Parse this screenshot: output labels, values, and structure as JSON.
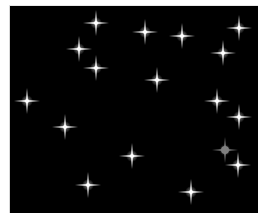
{
  "game": {
    "type": "sparkle-field",
    "background_color": "#000000",
    "star_color": "#ffffff",
    "odd_star_color": "#808080",
    "stars": [
      {
        "id": 1,
        "x": 86,
        "y": 17,
        "variant": "normal"
      },
      {
        "id": 2,
        "x": 69,
        "y": 43,
        "variant": "normal"
      },
      {
        "id": 3,
        "x": 86,
        "y": 62,
        "variant": "normal"
      },
      {
        "id": 4,
        "x": 135,
        "y": 26,
        "variant": "normal"
      },
      {
        "id": 5,
        "x": 172,
        "y": 30,
        "variant": "normal"
      },
      {
        "id": 6,
        "x": 229,
        "y": 22,
        "variant": "normal"
      },
      {
        "id": 7,
        "x": 213,
        "y": 47,
        "variant": "normal"
      },
      {
        "id": 8,
        "x": 147,
        "y": 74,
        "variant": "normal"
      },
      {
        "id": 9,
        "x": 207,
        "y": 95,
        "variant": "normal"
      },
      {
        "id": 10,
        "x": 229,
        "y": 111,
        "variant": "normal"
      },
      {
        "id": 11,
        "x": 17,
        "y": 95,
        "variant": "normal"
      },
      {
        "id": 12,
        "x": 55,
        "y": 121,
        "variant": "normal"
      },
      {
        "id": 13,
        "x": 122,
        "y": 150,
        "variant": "normal"
      },
      {
        "id": 14,
        "x": 215,
        "y": 144,
        "variant": "odd"
      },
      {
        "id": 15,
        "x": 228,
        "y": 159,
        "variant": "normal"
      },
      {
        "id": 16,
        "x": 78,
        "y": 179,
        "variant": "normal"
      },
      {
        "id": 17,
        "x": 181,
        "y": 186,
        "variant": "normal"
      }
    ]
  }
}
